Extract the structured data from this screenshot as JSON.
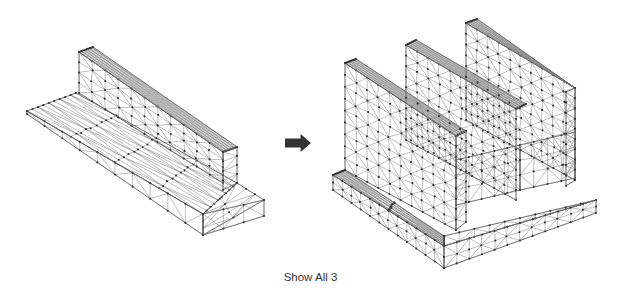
{
  "figure": {
    "caption": "Show All 3",
    "arrow_color": "#333333",
    "mesh_line_color": "#8a8a8a",
    "mesh_node_color": "#333333",
    "panels": [
      {
        "name": "t-section-mesh",
        "faces": [
          {
            "name": "flange-top-back",
            "quad": [
              [
                27,
                111
              ],
              [
                76,
                93
              ],
              [
                237,
                183
              ],
              [
                203,
                214
              ]
            ],
            "nu": 9,
            "nv": 4
          },
          {
            "name": "flange-top-front",
            "quad": [
              [
                27,
                111
              ],
              [
                203,
                214
              ],
              [
                203,
                235
              ],
              [
                27,
                118
              ]
            ],
            "nu": 9,
            "nv": 1,
            "skip": true
          },
          {
            "name": "flange-top-right",
            "quad": [
              [
                237,
                183
              ],
              [
                264,
                200
              ],
              [
                203,
                235
              ],
              [
                203,
                214
              ]
            ],
            "nu": 3,
            "nv": 2
          },
          {
            "name": "flange-front-edge",
            "quad": [
              [
                203,
                214
              ],
              [
                264,
                200
              ],
              [
                264,
                216
              ],
              [
                203,
                235
              ]
            ],
            "nu": 3,
            "nv": 1
          },
          {
            "name": "flange-front-long",
            "quad": [
              [
                27,
                111
              ],
              [
                203,
                214
              ],
              [
                203,
                235
              ],
              [
                27,
                114
              ]
            ],
            "nu": 10,
            "nv": 1
          },
          {
            "name": "web-side",
            "quad": [
              [
                79,
                52
              ],
              [
                223,
                152
              ],
              [
                223,
                183
              ],
              [
                79,
                93
              ]
            ],
            "nu": 11,
            "nv": 4
          },
          {
            "name": "web-top",
            "quad": [
              [
                79,
                52
              ],
              [
                93,
                47
              ],
              [
                237,
                147
              ],
              [
                223,
                152
              ]
            ],
            "nu": 11,
            "nv": 1
          },
          {
            "name": "web-end",
            "quad": [
              [
                223,
                152
              ],
              [
                237,
                147
              ],
              [
                237,
                183
              ],
              [
                223,
                190
              ]
            ],
            "nu": 1,
            "nv": 4
          }
        ]
      },
      {
        "name": "triple-wall-mesh",
        "faces": [
          {
            "name": "base-top-left",
            "quad": [
              [
                333,
                175
              ],
              [
                345,
                170
              ],
              [
                444,
                236
              ],
              [
                444,
                246
              ]
            ],
            "nu": 11,
            "nv": 2
          },
          {
            "name": "base-front-left",
            "quad": [
              [
                333,
                175
              ],
              [
                444,
                246
              ],
              [
                444,
                268
              ],
              [
                333,
                190
              ]
            ],
            "nu": 12,
            "nv": 2
          },
          {
            "name": "base-top-right",
            "quad": [
              [
                444,
                236
              ],
              [
                596,
                200
              ],
              [
                596,
                200
              ],
              [
                444,
                246
              ]
            ],
            "nu": 10,
            "nv": 1
          },
          {
            "name": "base-front-right",
            "quad": [
              [
                444,
                246
              ],
              [
                596,
                200
              ],
              [
                596,
                213
              ],
              [
                444,
                268
              ]
            ],
            "nu": 12,
            "nv": 2
          },
          {
            "name": "floor-channel-1",
            "quad": [
              [
                456,
                160
              ],
              [
                520,
                145
              ],
              [
                520,
                190
              ],
              [
                456,
                205
              ]
            ],
            "nu": 5,
            "nv": 3
          },
          {
            "name": "floor-channel-2",
            "quad": [
              [
                520,
                145
              ],
              [
                575,
                132
              ],
              [
                575,
                178
              ],
              [
                520,
                190
              ]
            ],
            "nu": 4,
            "nv": 3
          },
          {
            "name": "wall-1-side",
            "quad": [
              [
                345,
                63
              ],
              [
                456,
                136
              ],
              [
                456,
                230
              ],
              [
                345,
                170
              ]
            ],
            "nu": 10,
            "nv": 9
          },
          {
            "name": "wall-1-top",
            "quad": [
              [
                345,
                63
              ],
              [
                356,
                59
              ],
              [
                466,
                131
              ],
              [
                456,
                136
              ]
            ],
            "nu": 10,
            "nv": 1
          },
          {
            "name": "wall-1-end",
            "quad": [
              [
                456,
                136
              ],
              [
                466,
                131
              ],
              [
                466,
                222
              ],
              [
                456,
                230
              ]
            ],
            "nu": 1,
            "nv": 9
          },
          {
            "name": "wall-2-side",
            "quad": [
              [
                406,
                45
              ],
              [
                516,
                109
              ],
              [
                516,
                200
              ],
              [
                406,
                140
              ]
            ],
            "nu": 10,
            "nv": 9
          },
          {
            "name": "wall-2-top",
            "quad": [
              [
                406,
                45
              ],
              [
                416,
                40
              ],
              [
                526,
                104
              ],
              [
                516,
                109
              ]
            ],
            "nu": 10,
            "nv": 1
          },
          {
            "name": "wall-3-side",
            "quad": [
              [
                466,
                23
              ],
              [
                575,
                88
              ],
              [
                575,
                180
              ],
              [
                466,
                120
              ]
            ],
            "nu": 10,
            "nv": 9
          },
          {
            "name": "wall-3-top",
            "quad": [
              [
                466,
                23
              ],
              [
                477,
                19
              ],
              [
                575,
                88
              ],
              [
                575,
                88
              ]
            ],
            "nu": 10,
            "nv": 1
          },
          {
            "name": "wall-3-end",
            "quad": [
              [
                566,
                92
              ],
              [
                575,
                88
              ],
              [
                575,
                180
              ],
              [
                566,
                186
              ]
            ],
            "nu": 1,
            "nv": 9
          }
        ]
      }
    ],
    "arrow": {
      "x": 285,
      "y": 134,
      "w": 26,
      "h": 18
    }
  }
}
